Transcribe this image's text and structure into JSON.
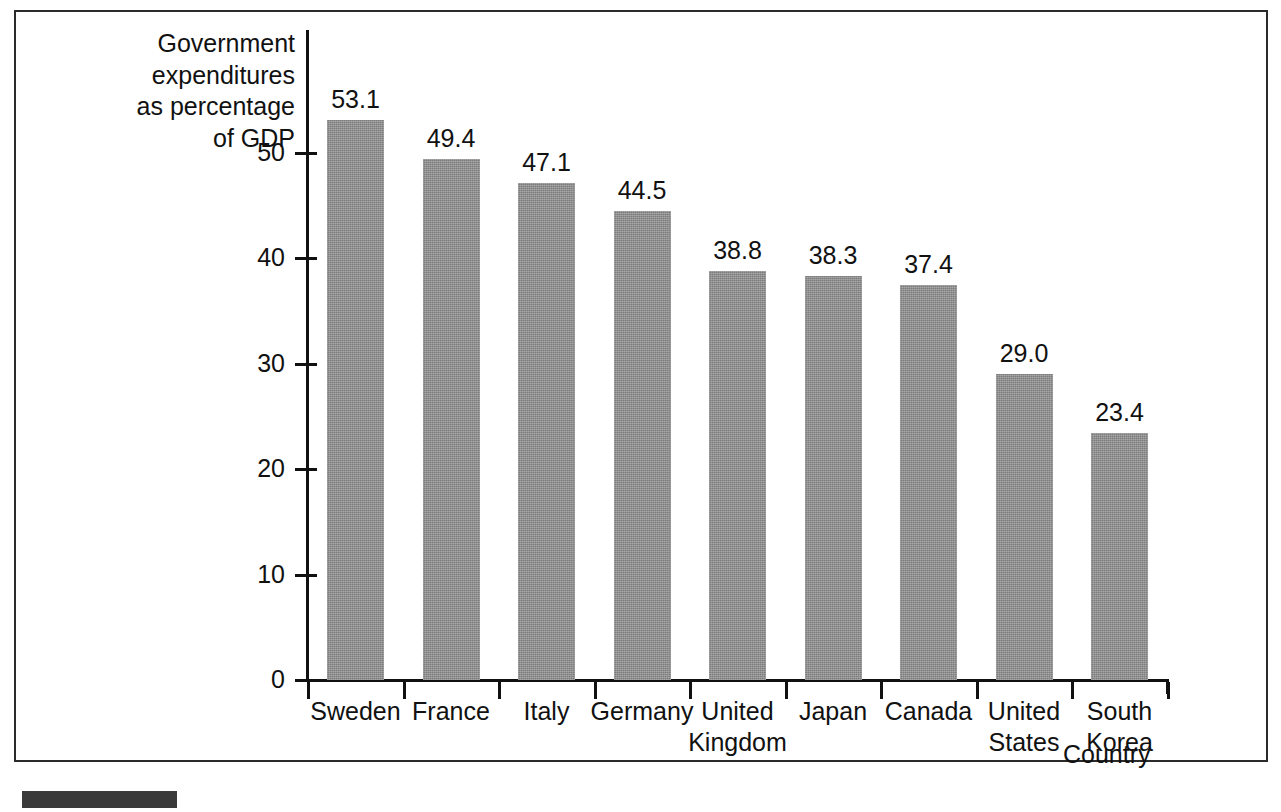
{
  "chart_data": {
    "type": "bar",
    "title": "",
    "xlabel": "Country",
    "ylabel": "Government expenditures as percentage of GDP",
    "ylabel_lines": [
      "Government",
      "expenditures",
      "as percentage",
      "of GDP"
    ],
    "categories": [
      "Sweden",
      "France",
      "Italy",
      "Germany",
      "United Kingdom",
      "Japan",
      "Canada",
      "United States",
      "South Korea"
    ],
    "category_lines": [
      [
        "Sweden"
      ],
      [
        "France"
      ],
      [
        "Italy"
      ],
      [
        "Germany"
      ],
      [
        "United",
        "Kingdom"
      ],
      [
        "Japan"
      ],
      [
        "Canada"
      ],
      [
        "United",
        "States"
      ],
      [
        "South",
        "Korea"
      ]
    ],
    "values": [
      53.1,
      49.4,
      47.1,
      44.5,
      38.8,
      38.3,
      37.4,
      29.0,
      23.4
    ],
    "value_labels": [
      "53.1",
      "49.4",
      "47.1",
      "44.5",
      "38.8",
      "38.3",
      "37.4",
      "29.0",
      "23.4"
    ],
    "ylim": [
      0,
      53.1
    ],
    "yticks": [
      0,
      10,
      20,
      30,
      40,
      50
    ],
    "ytick_labels": [
      "0",
      "10",
      "20",
      "30",
      "40",
      "50"
    ],
    "grid": false,
    "legend": false,
    "bar_color": "#8e8e8e",
    "axis_color": "#111111",
    "frame_color": "#2b2b2b"
  }
}
